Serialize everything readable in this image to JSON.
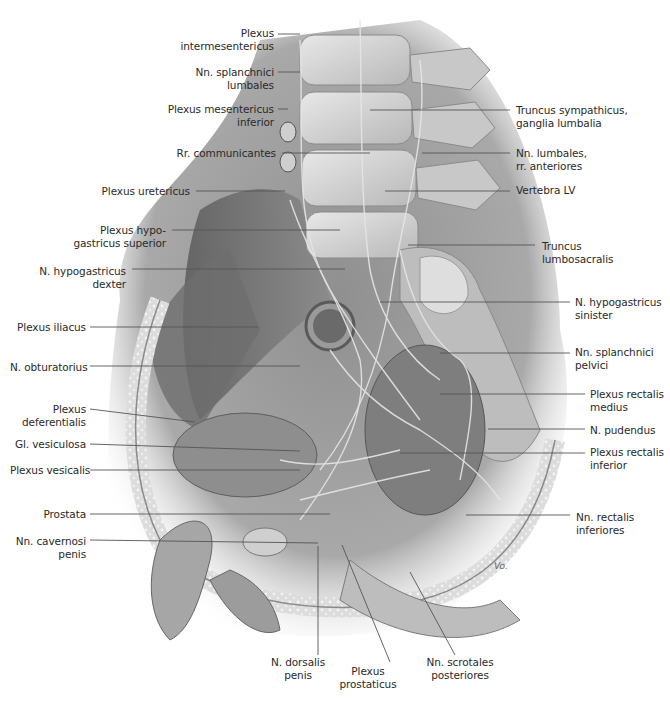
{
  "figure": {
    "render_style": "grayscale anatomical illustration",
    "colors": {
      "background": "#ffffff",
      "label_text": "#2a2a2a",
      "leader_line": "#555555"
    },
    "signature": "Vo."
  },
  "labels_left": [
    {
      "id": "plexus-intermesentericus",
      "text": "Plexus\nintermesentericus",
      "x": 148,
      "y": 27,
      "w": 126,
      "line": [
        [
          278,
          34
        ],
        [
          300,
          34
        ]
      ]
    },
    {
      "id": "nn-splanchnici-lumbales",
      "text": "Nn. splanchnici\nlumbales",
      "x": 148,
      "y": 66,
      "w": 126,
      "line": [
        [
          278,
          72
        ],
        [
          300,
          72
        ]
      ]
    },
    {
      "id": "plexus-mesentericus-inferior",
      "text": "Plexus mesentericus\ninferior",
      "x": 128,
      "y": 103,
      "w": 146,
      "line": [
        [
          278,
          109
        ],
        [
          288,
          109
        ]
      ]
    },
    {
      "id": "rr-communicantes",
      "text": "Rr. communicantes",
      "x": 120,
      "y": 147,
      "w": 156,
      "line": [
        [
          282,
          153
        ],
        [
          370,
          153
        ]
      ]
    },
    {
      "id": "plexus-uretericus",
      "text": "Plexus uretericus",
      "x": 60,
      "y": 185,
      "w": 130,
      "line": [
        [
          196,
          191
        ],
        [
          285,
          191
        ]
      ]
    },
    {
      "id": "plexus-hypogastricus-superior",
      "text": "Plexus hypo-\ngastricus superior",
      "x": 60,
      "y": 224,
      "w": 106,
      "line": [
        [
          172,
          230
        ],
        [
          340,
          230
        ]
      ]
    },
    {
      "id": "n-hypogastricus-dexter",
      "text": "N. hypogastricus\ndexter",
      "x": 30,
      "y": 265,
      "w": 96,
      "line": [
        [
          132,
          269
        ],
        [
          345,
          269
        ]
      ]
    },
    {
      "id": "plexus-iliacus",
      "text": "Plexus iliacus",
      "x": 10,
      "y": 321,
      "w": 76,
      "line": [
        [
          90,
          327
        ],
        [
          258,
          327
        ]
      ]
    },
    {
      "id": "n-obturatorius",
      "text": "N. obturatorius",
      "x": 10,
      "y": 361,
      "w": 76,
      "line": [
        [
          90,
          366
        ],
        [
          300,
          366
        ]
      ]
    },
    {
      "id": "plexus-deferentialis",
      "text": "Plexus\ndeferentialis",
      "x": 10,
      "y": 403,
      "w": 76,
      "line": [
        [
          90,
          409
        ],
        [
          195,
          422
        ]
      ]
    },
    {
      "id": "gl-vesiculosa",
      "text": "Gl. vesiculosa",
      "x": 10,
      "y": 438,
      "w": 76,
      "line": [
        [
          90,
          444
        ],
        [
          300,
          451
        ]
      ]
    },
    {
      "id": "plexus-vesicalis",
      "text": "Plexus vesicalis",
      "x": 10,
      "y": 464,
      "w": 76,
      "line": [
        [
          90,
          470
        ],
        [
          300,
          470
        ]
      ]
    },
    {
      "id": "prostata",
      "text": "Prostata",
      "x": 10,
      "y": 508,
      "w": 76,
      "line": [
        [
          90,
          514
        ],
        [
          330,
          514
        ]
      ]
    },
    {
      "id": "nn-cavernosi-penis",
      "text": "Nn. cavernosi\npenis",
      "x": 10,
      "y": 535,
      "w": 76,
      "line": [
        [
          90,
          540
        ],
        [
          318,
          543
        ]
      ]
    }
  ],
  "labels_right": [
    {
      "id": "truncus-sympathicus",
      "text": "Truncus sympathicus,\nganglia lumbalia",
      "x": 516,
      "y": 104,
      "line": [
        [
          370,
          110
        ],
        [
          510,
          110
        ]
      ]
    },
    {
      "id": "nn-lumbales",
      "text": "Nn. lumbales,\nrr. anteriores",
      "x": 516,
      "y": 147,
      "line": [
        [
          422,
          153
        ],
        [
          510,
          153
        ]
      ]
    },
    {
      "id": "vertebra-lv",
      "text": "Vertebra LV",
      "x": 516,
      "y": 184,
      "line": [
        [
          385,
          191
        ],
        [
          510,
          191
        ]
      ]
    },
    {
      "id": "truncus-lumbosacralis",
      "text": "Truncus\nlumbosacralis",
      "x": 542,
      "y": 240,
      "line": [
        [
          408,
          245
        ],
        [
          535,
          245
        ]
      ]
    },
    {
      "id": "n-hypogastricus-sinister",
      "text": "N. hypogastricus\nsinister",
      "x": 575,
      "y": 296,
      "line": [
        [
          380,
          302
        ],
        [
          570,
          302
        ]
      ]
    },
    {
      "id": "nn-splanchnici-pelvici",
      "text": "Nn. splanchnici\npelvici",
      "x": 575,
      "y": 346,
      "line": [
        [
          440,
          353
        ],
        [
          570,
          353
        ]
      ]
    },
    {
      "id": "plexus-rectalis-medius",
      "text": "Plexus rectalis\nmedius",
      "x": 590,
      "y": 388,
      "line": [
        [
          440,
          394
        ],
        [
          585,
          394
        ]
      ]
    },
    {
      "id": "n-pudendus",
      "text": "N. pudendus",
      "x": 590,
      "y": 424,
      "line": [
        [
          488,
          429
        ],
        [
          585,
          429
        ]
      ]
    },
    {
      "id": "plexus-rectalis-inferior",
      "text": "Plexus rectalis\ninferior",
      "x": 590,
      "y": 446,
      "line": [
        [
          400,
          453
        ],
        [
          585,
          453
        ]
      ]
    },
    {
      "id": "nn-rectalis-inferiores",
      "text": "Nn. rectalis\ninferiores",
      "x": 576,
      "y": 511,
      "line": [
        [
          466,
          515
        ],
        [
          570,
          515
        ]
      ]
    }
  ],
  "labels_bottom": [
    {
      "id": "n-dorsalis-penis",
      "text": "N. dorsalis\npenis",
      "x": 298,
      "y": 656,
      "line": [
        [
          318,
          546
        ],
        [
          318,
          655
        ]
      ]
    },
    {
      "id": "plexus-prostaticus",
      "text": "Plexus\nprostaticus",
      "x": 368,
      "y": 665,
      "line": [
        [
          342,
          545
        ],
        [
          390,
          662
        ]
      ]
    },
    {
      "id": "nn-scrotales-posteriores",
      "text": "Nn. scrotales\nposteriores",
      "x": 460,
      "y": 656,
      "line": [
        [
          410,
          572
        ],
        [
          455,
          655
        ]
      ]
    }
  ]
}
